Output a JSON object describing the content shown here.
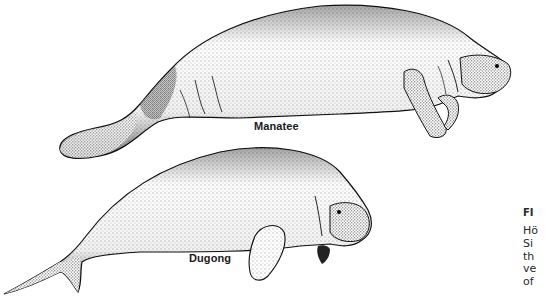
{
  "figure": {
    "illustration_style": "stipple ink drawing",
    "animals": [
      {
        "name": "manatee",
        "label": "Manatee"
      },
      {
        "name": "dugong",
        "label": "Dugong"
      }
    ]
  },
  "caption": {
    "title": "FI",
    "lines": [
      "Hö",
      "Si",
      "th",
      "ve",
      "of"
    ]
  },
  "colors": {
    "ink": "#1a1a1a",
    "background": "#ffffff",
    "caption_text": "#2a2a2a"
  }
}
